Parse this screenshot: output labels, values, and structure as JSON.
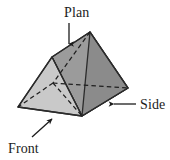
{
  "figure": {
    "background_color": "#ffffff",
    "outline_color": "#2b2b2b",
    "hidden_edge_color": "#1f1f1f",
    "faces": {
      "front_triangle": {
        "name": "front-left-triangular-face",
        "fill": "#c9c9c9"
      },
      "top_rectangle": {
        "name": "top-sloping-rectangular-face",
        "fill": "#9b9b9b"
      },
      "side_rectangle": {
        "name": "right-end-triangular-face",
        "fill": "#8b8b8b"
      }
    }
  },
  "labels": {
    "plan": {
      "text": "Plan",
      "arrow_direction": "down"
    },
    "side": {
      "text": "Side",
      "arrow_direction": "left"
    },
    "front": {
      "text": "Front",
      "arrow_direction": "up-right"
    }
  }
}
